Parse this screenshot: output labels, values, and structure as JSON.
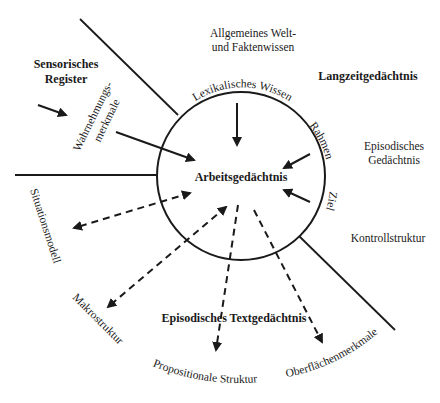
{
  "diagram": {
    "center": "Arbeitsgedächtnis",
    "regions": {
      "sensory": "Sensorisches Register",
      "sensory_line1": "Sensorisches",
      "sensory_line2": "Register",
      "longterm": "Langzeitgedächtnis",
      "episodic_text": "Episodisches Textgedächtnis"
    },
    "labels": {
      "world_knowledge_line1": "Allgemeines Welt-",
      "world_knowledge_line2": "und Faktenwissen",
      "episodic_memory_line1": "Episodisches",
      "episodic_memory_line2": "Gedächtnis",
      "control_structure": "Kontrollstruktur",
      "perception_line1": "Wahrnehmungs-",
      "perception_line2": "merkmale",
      "lexical": "Lexikalisches Wissen",
      "frame": "Rahmen",
      "goal": "Ziel",
      "situation_model": "Situationsmodell",
      "macrostructure": "Makrostruktur",
      "propositional": "Propositionale Struktur",
      "surface": "Oberflächenmerkmale"
    },
    "arrows": [
      {
        "from": "Sensorisches Register",
        "to": "Wahrnehmungsmerkmale",
        "style": "solid"
      },
      {
        "from": "Wahrnehmungsmerkmale",
        "to": "Arbeitsgedächtnis",
        "style": "solid"
      },
      {
        "from": "Lexikalisches Wissen",
        "to": "Arbeitsgedächtnis",
        "style": "solid"
      },
      {
        "from": "Rahmen",
        "to": "Arbeitsgedächtnis",
        "style": "solid"
      },
      {
        "from": "Ziel",
        "to": "Arbeitsgedächtnis",
        "style": "solid"
      },
      {
        "from": "Arbeitsgedächtnis",
        "to": "Situationsmodell",
        "style": "dashed",
        "bidirectional": true
      },
      {
        "from": "Arbeitsgedächtnis",
        "to": "Makrostruktur",
        "style": "dashed",
        "bidirectional": true
      },
      {
        "from": "Arbeitsgedächtnis",
        "to": "Propositionale Struktur",
        "style": "dashed"
      },
      {
        "from": "Arbeitsgedächtnis",
        "to": "Oberflächenmerkmale",
        "style": "dashed"
      }
    ]
  }
}
